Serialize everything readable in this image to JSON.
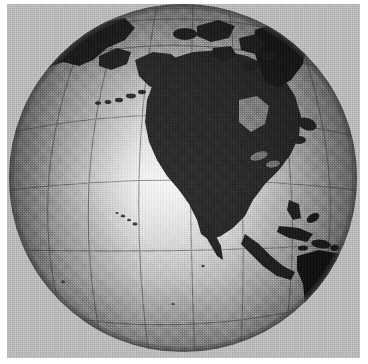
{
  "image": {
    "title": "Earth globe, North America hemisphere",
    "subject": "globe",
    "rendering": "halftone-dithered grayscale scan",
    "width_px": 368,
    "height_px": 364
  },
  "page": {
    "margin_color": "#ffffff",
    "background_color": "#b4b4b4"
  },
  "globe": {
    "center_x": 176,
    "center_y": 174,
    "radius": 174,
    "clipped_top": true,
    "clipped_bottom": true,
    "ocean_light_color": "#e9e9e9",
    "ocean_mid_color": "#9a9a9a",
    "limb_dark_color": "#5a5a5a",
    "land_color": "#2b2b2b",
    "land_shadow_color": "#141414",
    "graticule_color": "#555555",
    "highlight_x": 175,
    "highlight_y": 185
  },
  "graticule": {
    "label": "latitude and longitude grid",
    "spacing_degrees": 30,
    "parallels": [
      60,
      30,
      0,
      -30
    ],
    "meridians": [
      -150,
      -120,
      -90,
      -60,
      -30
    ]
  },
  "landmasses": [
    {
      "name": "north-america",
      "label": "North America"
    },
    {
      "name": "greenland",
      "label": "Greenland"
    },
    {
      "name": "canadian-arctic-archipelago",
      "label": "Canadian Arctic Archipelago"
    },
    {
      "name": "alaska",
      "label": "Alaska"
    },
    {
      "name": "aleutian-islands",
      "label": "Aleutian Islands"
    },
    {
      "name": "siberia",
      "label": "Siberia"
    },
    {
      "name": "central-america",
      "label": "Central America"
    },
    {
      "name": "caribbean-islands",
      "label": "Caribbean Islands"
    },
    {
      "name": "cuba",
      "label": "Cuba"
    },
    {
      "name": "south-america",
      "label": "South America"
    },
    {
      "name": "hawaiian-islands",
      "label": "Hawaiian Islands"
    }
  ],
  "features": {
    "gulf_of_mexico": "Gulf of Mexico",
    "hudson_bay": "Hudson Bay",
    "great_lakes": "Great Lakes",
    "pacific_ocean": "Pacific Ocean",
    "atlantic_ocean": "Atlantic Ocean",
    "baja_california": "Baja California"
  }
}
